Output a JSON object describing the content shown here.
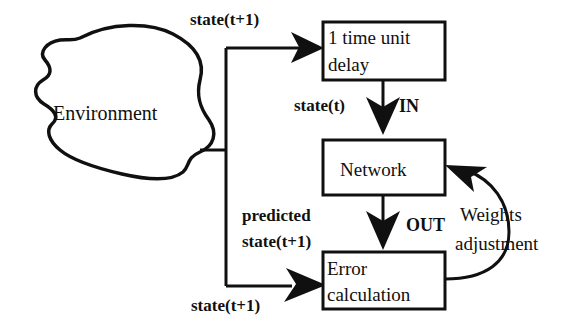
{
  "diagram": {
    "nodes": {
      "environment": {
        "label": "Environment",
        "shape": "blob"
      },
      "delay": {
        "line1": "1 time unit",
        "line2": "delay",
        "shape": "rect"
      },
      "network": {
        "label": "Network",
        "shape": "rect"
      },
      "error": {
        "line1": "Error",
        "line2": "calculation",
        "shape": "rect"
      }
    },
    "edge_labels": {
      "state_t_plus_1_top": "state(t+1)",
      "state_t": "state(t)",
      "in": "IN",
      "out": "OUT",
      "predicted_line1": "predicted",
      "predicted_line2": "state(t+1)",
      "state_t_plus_1_bottom": "state(t+1)",
      "weights_line1": "Weights",
      "weights_line2": "adjustment"
    },
    "colors": {
      "ink": "#101010",
      "paper": "#ffffff"
    }
  }
}
